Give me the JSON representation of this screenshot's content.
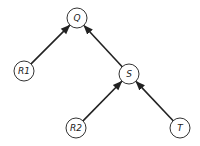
{
  "diagram": {
    "type": "directed-tree",
    "nodes": [
      {
        "id": "Q",
        "label": "Q",
        "x": 77,
        "y": 18
      },
      {
        "id": "R1",
        "label": "R1",
        "x": 24,
        "y": 71
      },
      {
        "id": "S",
        "label": "S",
        "x": 129,
        "y": 74
      },
      {
        "id": "R2",
        "label": "R2",
        "x": 76,
        "y": 128
      },
      {
        "id": "T",
        "label": "T",
        "x": 180,
        "y": 128
      }
    ],
    "edges": [
      {
        "from": "R1",
        "to": "Q"
      },
      {
        "from": "S",
        "to": "Q"
      },
      {
        "from": "R2",
        "to": "S"
      },
      {
        "from": "T",
        "to": "S"
      }
    ],
    "node_radius": 10,
    "colors": {
      "stroke": "#222222",
      "fill": "#ffffff"
    }
  }
}
